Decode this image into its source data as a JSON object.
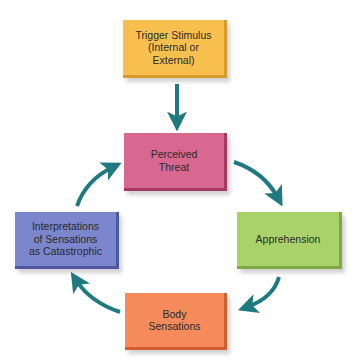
{
  "diagram": {
    "type": "cycle-flowchart",
    "arrow_color": "#1f7a80",
    "nodes": [
      {
        "id": "trigger",
        "label": "Trigger Stimulus\n(Internal or External)",
        "color": "#f7c04e"
      },
      {
        "id": "threat",
        "label": "Perceived\nThreat",
        "color": "#d8688f"
      },
      {
        "id": "apprehension",
        "label": "Apprehension",
        "color": "#a9d36a"
      },
      {
        "id": "body",
        "label": "Body\nSensations",
        "color": "#f58a5a"
      },
      {
        "id": "interpretation",
        "label": "Interpretations\nof Sensations\nas Catastrophic",
        "color": "#7b86cc"
      }
    ],
    "edges": [
      {
        "from": "trigger",
        "to": "threat"
      },
      {
        "from": "threat",
        "to": "apprehension"
      },
      {
        "from": "apprehension",
        "to": "body"
      },
      {
        "from": "body",
        "to": "interpretation"
      },
      {
        "from": "interpretation",
        "to": "threat"
      }
    ]
  }
}
